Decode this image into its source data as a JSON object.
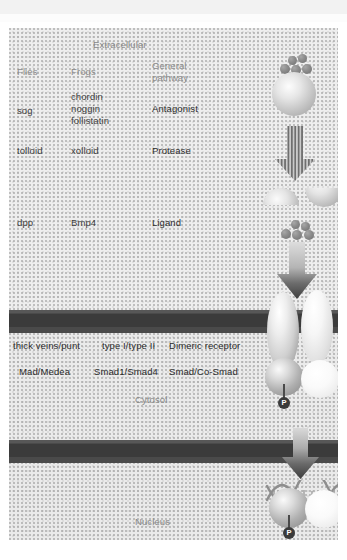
{
  "figure": {
    "caption_fragment": "",
    "regions": {
      "extracellular": "Extracellular",
      "cytosol": "Cytosol",
      "nucleus": "Nucleus"
    },
    "columns": {
      "flies": "Flies",
      "frogs": "Frogs",
      "general": "General pathway",
      "general_line1": "General",
      "general_line2": "pathway"
    },
    "rows": [
      {
        "id": "antagonist",
        "flies": "sog",
        "frogs_line1": "chordin",
        "frogs_line2": "noggin",
        "frogs_line3": "follistatin",
        "general": "Antagonist"
      },
      {
        "id": "protease",
        "flies": "tolloid",
        "frogs": "xolloid",
        "general": "Protease"
      },
      {
        "id": "ligand",
        "flies": "dpp",
        "frogs": "Bmp4",
        "general": "Ligand"
      },
      {
        "id": "receptor",
        "flies": "thick veins/punt",
        "frogs": "type I/type II",
        "general": "Dimeric receptor"
      },
      {
        "id": "smad",
        "flies": "Mad/Medea",
        "frogs": "Smad1/Smad4",
        "general": "Smad/Co-Smad"
      }
    ],
    "graphics": {
      "phosphate_label": "P",
      "ligand_bead_count": 4,
      "free_ligand_bead_count": 5
    },
    "colors": {
      "membrane": "#4a4a4a",
      "membrane_inner": "#3b3b3b",
      "background": "#ededed",
      "label_text": "#3c3c3c",
      "section_text": "#878787",
      "bead": "#7b7b7b",
      "phosphate": "#3a3a3a"
    }
  }
}
